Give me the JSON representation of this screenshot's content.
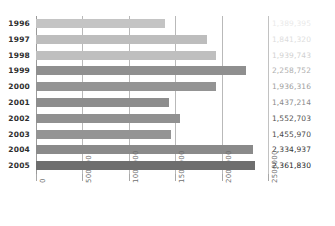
{
  "chart_data": {
    "type": "bar",
    "orientation": "horizontal",
    "title": "",
    "xlabel": "",
    "ylabel": "",
    "categories": [
      "1996",
      "1997",
      "1998",
      "1999",
      "2000",
      "2001",
      "2002",
      "2003",
      "2004",
      "2005"
    ],
    "values": [
      1389395,
      1841320,
      1939743,
      2258752,
      1936316,
      1437214,
      1552703,
      1455970,
      2334937,
      2361830
    ],
    "value_labels": [
      "1,389,395",
      "1,841,320",
      "1,939,743",
      "2,258,752",
      "1,936,316",
      "1,437,214",
      "1,552,703",
      "1,455,970",
      "2,334,937",
      "2,361,830"
    ],
    "bar_colors": [
      "#c4c4c4",
      "#bdbdbd",
      "#bfbfbf",
      "#8f8f8f",
      "#949494",
      "#8d8d8d",
      "#909090",
      "#949494",
      "#8a8a8a",
      "#6e6e6e"
    ],
    "label_opacities": [
      0.1,
      0.16,
      0.22,
      0.38,
      0.46,
      0.55,
      0.8,
      0.84,
      0.9,
      1.0
    ],
    "xlim": [
      0,
      2500000
    ],
    "xticks": [
      0,
      500000,
      1000000,
      1500000,
      2000000,
      2500000
    ],
    "xtick_labels": [
      "0",
      "500000",
      "1000000",
      "1500000",
      "2000000",
      "2500000"
    ],
    "grid": true,
    "legend": null
  }
}
